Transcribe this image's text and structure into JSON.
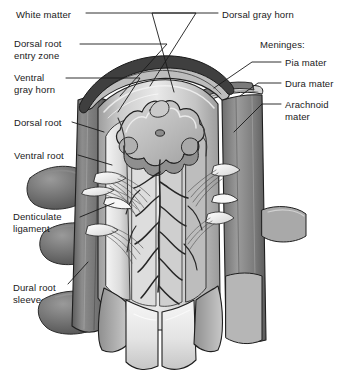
{
  "figure": {
    "background_color": "#ffffff",
    "ink_color": "#1a1a1a",
    "width": 345,
    "height": 377
  },
  "labels_left": [
    {
      "name": "white-matter",
      "text": "White matter",
      "x": 16,
      "y": 9
    },
    {
      "name": "dorsal-root-entry-zone",
      "text": "Dorsal root\nentry zone",
      "x": 14,
      "y": 38
    },
    {
      "name": "ventral-gray-horn",
      "text": "Ventral\ngray horn",
      "x": 14,
      "y": 72
    },
    {
      "name": "dorsal-root",
      "text": "Dorsal root",
      "x": 14,
      "y": 118
    },
    {
      "name": "ventral-root",
      "text": "Ventral root",
      "x": 14,
      "y": 150
    },
    {
      "name": "denticulate-ligament",
      "text": "Denticulate\nligament",
      "x": 13,
      "y": 212
    },
    {
      "name": "dural-root-sleeve",
      "text": "Dural root\nsleeve",
      "x": 13,
      "y": 283
    }
  ],
  "labels_right": [
    {
      "name": "dorsal-gray-horn",
      "text": "Dorsal gray horn",
      "x": 222,
      "y": 9
    },
    {
      "name": "meninges-heading",
      "text": "Meninges:",
      "x": 260,
      "y": 40
    },
    {
      "name": "pia-mater",
      "text": "Pia mater",
      "x": 285,
      "y": 58
    },
    {
      "name": "dura-mater",
      "text": "Dura mater",
      "x": 285,
      "y": 79
    },
    {
      "name": "arachnoid-mater",
      "text": "Arachnoid\nmater",
      "x": 285,
      "y": 100
    }
  ],
  "leader_lines": [
    {
      "name": "leader-white-matter",
      "points": "86,13 196,13 150,86"
    },
    {
      "name": "leader-dorsal-root-entry-zone",
      "points": "80,44 167,44 120,96"
    },
    {
      "name": "leader-ventral-gray-horn",
      "points": "66,78 140,78 118,110"
    },
    {
      "name": "leader-dorsal-root",
      "points": "72,122 104,131"
    },
    {
      "name": "leader-ventral-root",
      "points": "76,155 110,163"
    },
    {
      "name": "leader-denticulate-ligament",
      "points": "78,217 112,203"
    },
    {
      "name": "leader-dural-root-sleeve",
      "points": "66,284 86,264"
    },
    {
      "name": "leader-dorsal-gray-horn",
      "points": "218,13 150,13 176,90"
    },
    {
      "name": "leader-pia-mater",
      "points": "281,62 252,62 214,88"
    },
    {
      "name": "leader-dura-mater",
      "points": "281,83 258,83 238,98"
    },
    {
      "name": "leader-arachnoid-mater",
      "points": "281,104 262,104 232,134"
    }
  ],
  "art_palette": {
    "outline": "#1f1f1f",
    "dura_outer_dark": "#5d5d5d",
    "dura_mid": "#8e8e8e",
    "dura_light": "#c9c9c9",
    "cord_light": "#ededed",
    "cord_mid": "#cfcfcf",
    "cord_shadow": "#a8a8a8",
    "gray_matter": "#b9b9b9",
    "gray_matter_light": "#d8d8d8",
    "rootlet_white": "#fafafa",
    "sleeve_dark": "#6b6b6b",
    "sleeve_darker": "#4f4f4f",
    "vessel": "#2b2b2b"
  },
  "art_parts": [
    "dura-mater-sheath-left",
    "dura-mater-sheath-right",
    "dura-reflected-flap-right",
    "arachnoid-mater-layer",
    "pia-mater-surface",
    "spinal-cord-body",
    "gray-matter-butterfly",
    "dorsal-gray-horn-shape",
    "ventral-gray-horn-shape",
    "dorsal-root-entry-zone-groove",
    "dorsal-rootlets-bundle-left",
    "dorsal-rootlets-bundle-right",
    "ventral-rootlets-bundle-left",
    "ventral-rootlets-bundle-right",
    "denticulate-ligament-left",
    "denticulate-ligament-right",
    "dural-root-sleeve-upper-left",
    "dural-root-sleeve-lower-left",
    "dural-root-sleeve-right",
    "surface-vessels",
    "cord-cut-bottom"
  ]
}
